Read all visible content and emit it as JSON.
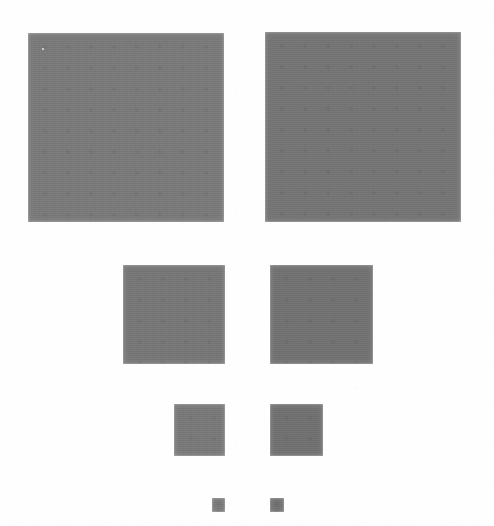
{
  "figure": {
    "background_color": "#fefefe",
    "canvas": {
      "width": 494,
      "height": 526
    },
    "columns": [
      {
        "name": "left",
        "alignment": "right-aligned at x=225"
      },
      {
        "name": "right",
        "alignment": "left-aligned at x=270"
      }
    ],
    "rows": [
      {
        "name": "row-1",
        "size_label": "large"
      },
      {
        "name": "row-2",
        "size_label": "medium"
      },
      {
        "name": "row-3",
        "size_label": "small"
      },
      {
        "name": "row-4",
        "size_label": "tiny"
      }
    ],
    "patches": [
      {
        "id": "patch-large-left",
        "row": 1,
        "column": "left",
        "x": 28,
        "y": 33,
        "width": 196,
        "height": 189,
        "color": "#7e7e7e"
      },
      {
        "id": "patch-large-right",
        "row": 1,
        "column": "right",
        "x": 265,
        "y": 32,
        "width": 196,
        "height": 190,
        "color": "#797979"
      },
      {
        "id": "patch-medium-left",
        "row": 2,
        "column": "left",
        "x": 123,
        "y": 265,
        "width": 102,
        "height": 99,
        "color": "#7b7b7b"
      },
      {
        "id": "patch-medium-right",
        "row": 2,
        "column": "right",
        "x": 270,
        "y": 265,
        "width": 103,
        "height": 99,
        "color": "#767676"
      },
      {
        "id": "patch-small-left",
        "row": 3,
        "column": "left",
        "x": 174,
        "y": 404,
        "width": 51,
        "height": 52,
        "color": "#7d7d7d"
      },
      {
        "id": "patch-small-right",
        "row": 3,
        "column": "right",
        "x": 270,
        "y": 404,
        "width": 53,
        "height": 52,
        "color": "#757575"
      },
      {
        "id": "patch-tiny-left",
        "row": 4,
        "column": "left",
        "x": 212,
        "y": 498,
        "width": 13,
        "height": 14,
        "color": "#7c7c7c"
      },
      {
        "id": "patch-tiny-right",
        "row": 4,
        "column": "right",
        "x": 270,
        "y": 498,
        "width": 14,
        "height": 14,
        "color": "#747474"
      }
    ],
    "speck": {
      "x": 42,
      "y": 48,
      "color": "#f2f2f2"
    }
  }
}
